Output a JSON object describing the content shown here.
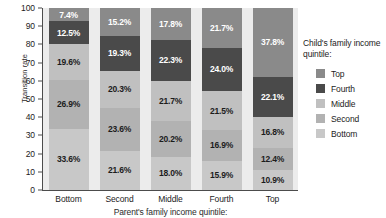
{
  "chart_data": {
    "type": "bar",
    "stacked": true,
    "title": "",
    "xlabel": "Parent's family income quintile:",
    "ylabel": "Transition rate",
    "ylim": [
      0,
      100
    ],
    "yticks": [
      100,
      90,
      80,
      70,
      60,
      50,
      40,
      30,
      20,
      10,
      0
    ],
    "grid": false,
    "legend_position": "right",
    "legend_title": "Child's family income quintile:",
    "categories": [
      "Bottom",
      "Second",
      "Middle",
      "Fourth",
      "Top"
    ],
    "series": [
      {
        "name": "Top",
        "color": "#8a8a8a",
        "text_color": "#ffffff",
        "values": [
          7.4,
          15.2,
          17.8,
          21.7,
          37.8
        ],
        "labels": [
          "7.4%",
          "15.2%",
          "17.8%",
          "21.7%",
          "37.8%"
        ]
      },
      {
        "name": "Fourth",
        "color": "#4a4a4a",
        "text_color": "#ffffff",
        "values": [
          12.5,
          19.3,
          22.3,
          24.0,
          22.1
        ],
        "labels": [
          "12.5%",
          "19.3%",
          "22.3%",
          "24.0%",
          "22.1%"
        ]
      },
      {
        "name": "Middle",
        "color": "#c0c0c0",
        "text_color": "#1c1c1c",
        "values": [
          19.6,
          20.3,
          21.7,
          21.5,
          16.8
        ],
        "labels": [
          "19.6%",
          "20.3%",
          "21.7%",
          "21.5%",
          "16.8%"
        ]
      },
      {
        "name": "Second",
        "color": "#b2b2b2",
        "text_color": "#1c1c1c",
        "values": [
          26.9,
          23.6,
          20.2,
          16.9,
          12.4
        ],
        "labels": [
          "26.9%",
          "23.6%",
          "20.2%",
          "16.9%",
          "12.4%"
        ]
      },
      {
        "name": "Bottom",
        "color": "#c8c8c8",
        "text_color": "#1c1c1c",
        "values": [
          33.6,
          21.6,
          18.0,
          15.9,
          10.9
        ],
        "labels": [
          "33.6%",
          "21.6%",
          "18.0%",
          "15.9%",
          "10.9%"
        ]
      }
    ]
  }
}
